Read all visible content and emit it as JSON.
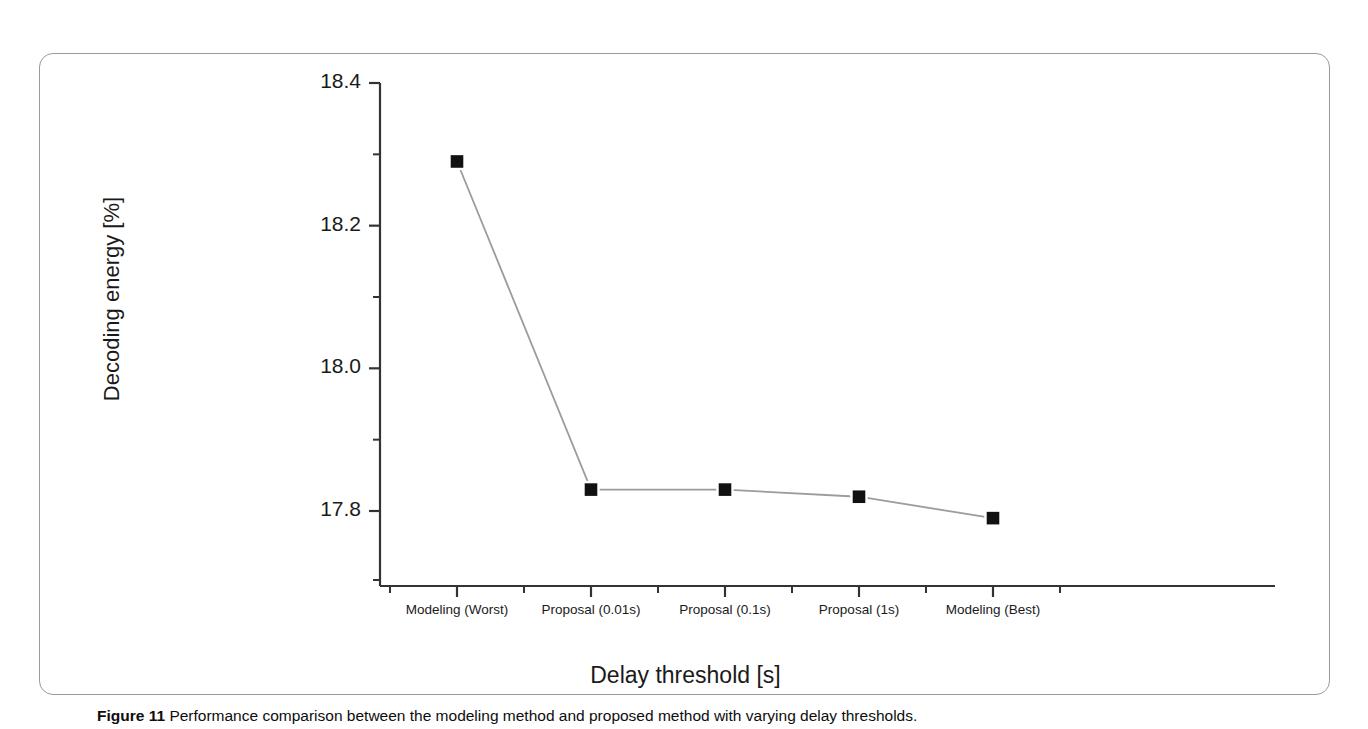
{
  "figure": {
    "caption_label": "Figure 11",
    "caption_text": "Performance comparison between the modeling method and proposed method with varying delay thresholds."
  },
  "chart_data": {
    "type": "line",
    "title": "",
    "subtitle": "",
    "xlabel": "Delay threshold [s]",
    "ylabel": "Decoding energy [%]",
    "categories": [
      "Modeling (Worst)",
      "Proposal (0.01s)",
      "Proposal (0.1s)",
      "Proposal (1s)",
      "Modeling (Best)"
    ],
    "values": [
      18.29,
      17.83,
      17.83,
      17.82,
      17.79
    ],
    "series": [
      {
        "name": "Decoding energy",
        "values": [
          18.29,
          17.83,
          17.83,
          17.82,
          17.79
        ],
        "marker": "filled-square",
        "marker_color": "#111111",
        "line_color": "#9c9c9c"
      }
    ],
    "ylim": [
      17.72,
      18.44
    ],
    "y_ticks": [
      "18.4",
      "18.2",
      "18.0",
      "17.8"
    ],
    "y_tick_values": [
      18.4,
      18.2,
      18.0,
      17.8
    ],
    "y_minor_ticks": [
      18.3,
      18.1,
      17.9
    ],
    "grid": false,
    "legend": false,
    "axis_color": "#333333",
    "background": "#ffffff"
  }
}
